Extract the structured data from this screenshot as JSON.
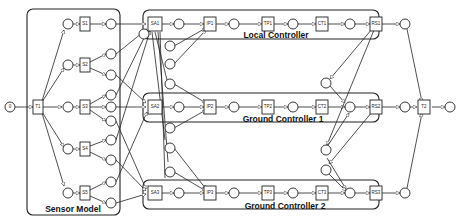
{
  "diagram": {
    "type": "petri-net",
    "groups": {
      "sensor_model": "Sensor Model",
      "local_controller": "Local Controller",
      "ground_controller_1": "Ground Controller 1",
      "ground_controller_2": "Ground Controller 2"
    },
    "transitions": {
      "t1": "T1",
      "t2": "T2",
      "s1": "S1",
      "s2": "S2",
      "s3": "S3",
      "s4": "S4",
      "s5": "S5",
      "sa1": "SA1",
      "ip1": "IP1",
      "tp1": "TP1",
      "ct1": "CT1",
      "rs1": "RS1",
      "sa2": "SA2",
      "ip2": "IP2",
      "tp2": "TP2",
      "ct2": "CT2",
      "rs2": "RS2",
      "sa3": "SA3",
      "ip3": "IP3",
      "tp3": "TP3",
      "ct3": "CT3",
      "rs3": "RS3"
    },
    "initial_place": "0"
  }
}
